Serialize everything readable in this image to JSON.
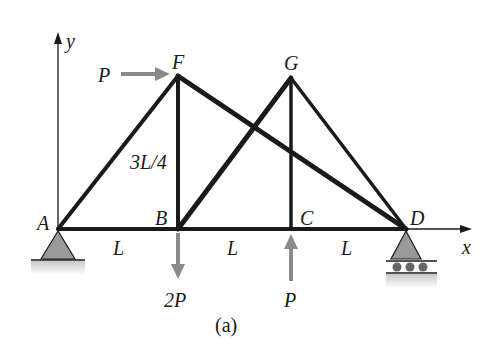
{
  "figure": {
    "caption": "(a)",
    "colors": {
      "member": "#1a1a1a",
      "load_arrow": "#8a8a8a",
      "support_fill": "#9a9a9a",
      "background": "#ffffff"
    }
  },
  "axes": {
    "x_label": "x",
    "y_label": "y"
  },
  "joints": [
    {
      "id": "A",
      "label": "A"
    },
    {
      "id": "B",
      "label": "B"
    },
    {
      "id": "C",
      "label": "C"
    },
    {
      "id": "D",
      "label": "D"
    },
    {
      "id": "F",
      "label": "F"
    },
    {
      "id": "G",
      "label": "G"
    }
  ],
  "members": [
    "AB",
    "BC",
    "CD",
    "AF",
    "BF",
    "FD",
    "BG",
    "CG",
    "GD"
  ],
  "dimensions": {
    "span_AB": "L",
    "span_BC": "L",
    "span_CD": "L",
    "height_BF": "3L/4"
  },
  "loads": [
    {
      "joint": "F",
      "direction": "right",
      "label": "P"
    },
    {
      "joint": "B",
      "direction": "down",
      "label": "2P"
    },
    {
      "joint": "C",
      "direction": "up",
      "label": "P"
    }
  ],
  "supports": [
    {
      "joint": "A",
      "type": "pin"
    },
    {
      "joint": "D",
      "type": "roller"
    }
  ]
}
